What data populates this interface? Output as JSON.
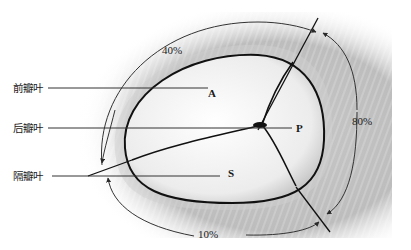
{
  "figure": {
    "type": "anatomical-diagram",
    "leaflet_labels": {
      "anterior": "前瓣叶",
      "posterior": "后瓣叶",
      "septal": "隔瓣叶"
    },
    "leaflet_letters": {
      "anterior": "A",
      "posterior": "P",
      "septal": "S"
    },
    "percentages": {
      "top_arc": "40%",
      "right_arc": "80%",
      "bottom_arc": "10%"
    },
    "colors": {
      "background": "#ffffff",
      "shading": "#b4b4b4",
      "annulus_ring": "#d8d8d8",
      "lines": "#1a1a1a",
      "leaflet_fill": "#f2f2f2"
    }
  }
}
